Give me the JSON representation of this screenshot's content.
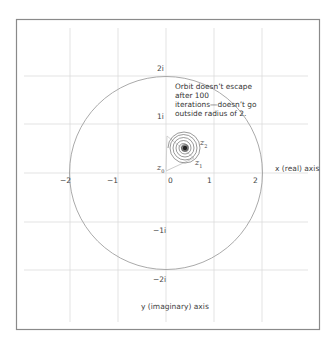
{
  "diagram": {
    "type": "complex-plane orbit diagram",
    "x_axis_label": "x (real) axis",
    "y_axis_label": "y (imaginary) axis",
    "x_ticks": [
      "−2",
      "−1",
      "0",
      "1",
      "2"
    ],
    "y_ticks": [
      "2i",
      "1i",
      "−1i",
      "−2i"
    ],
    "annotation_lines": [
      "Orbit doesn’t escape",
      "after 100",
      "iterations—doesn’t go",
      "outside radius of 2."
    ],
    "orbit_labels": {
      "z0": {
        "base": "z",
        "sub": "0"
      },
      "z1": {
        "base": "z",
        "sub": "1"
      },
      "z2": {
        "base": "z",
        "sub": "2"
      }
    },
    "escape_radius": 2,
    "iterations": 100,
    "colors": {
      "grid": "#d8d8d8",
      "circle": "#9a9a9a",
      "frame": "#8a8a8a",
      "orbit": "#333333",
      "text": "#444444"
    }
  }
}
